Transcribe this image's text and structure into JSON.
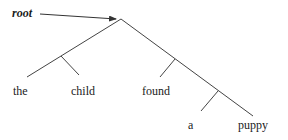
{
  "diagram": {
    "type": "binary-branching-tree",
    "root_label": "root",
    "words": [
      {
        "text": "the",
        "x": 13,
        "y": 85
      },
      {
        "text": "child",
        "x": 71,
        "y": 85
      },
      {
        "text": "found",
        "x": 142,
        "y": 85
      },
      {
        "text": "a",
        "x": 188,
        "y": 119
      },
      {
        "text": "puppy",
        "x": 238,
        "y": 119
      }
    ],
    "line_color": "#444444",
    "text_color": "#1a1a1a",
    "structure": "[[the child] [found [a puppy]]]"
  }
}
